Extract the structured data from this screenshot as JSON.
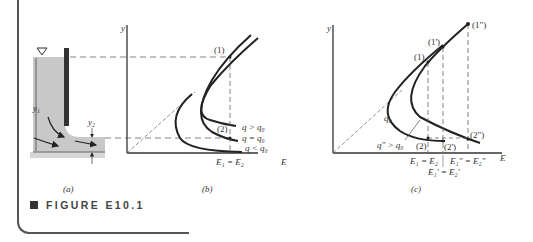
{
  "figure": {
    "caption": "FIGURE E10.1",
    "panels": {
      "a": {
        "label": "(a)",
        "depth_upstream": "y",
        "depth_upstream_sub": "1",
        "depth_downstream": "y",
        "depth_downstream_sub": "2",
        "free_surface_symbol": "▽"
      },
      "b": {
        "label": "(b)",
        "y_axis": "y",
        "x_axis": "E",
        "point_1": "(1)",
        "point_2": "(2)",
        "curve_labels": [
          "q > q₀",
          "q = q₀",
          "q < q₀"
        ],
        "energy_label": "E₁ = E₂"
      },
      "c": {
        "label": "(c)",
        "y_axis": "y",
        "x_axis": "E",
        "points": [
          "(1)",
          "(1')",
          "(1\")",
          "(2)",
          "(2')",
          "(2\")"
        ],
        "curve_labels": [
          "q₀",
          "q\" > q₀"
        ],
        "energy_labels": [
          "E₁ = E₂",
          "E₁'' = E₂''",
          "E₁' = E₂'"
        ]
      }
    }
  },
  "colors": {
    "water": "#c8c8c8",
    "line": "#222222",
    "dash": "#666666"
  }
}
